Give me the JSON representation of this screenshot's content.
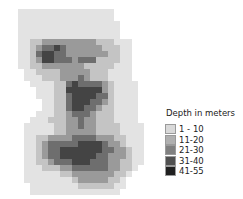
{
  "legend": {
    "title": "Depth in meters",
    "classes": [
      {
        "label": "1 - 10",
        "color": "#d9d9d9"
      },
      {
        "label": "11-20",
        "color": "#b0b0b0"
      },
      {
        "label": "21-30",
        "color": "#808080"
      },
      {
        "label": "31-40",
        "color": "#505050"
      },
      {
        "label": "41-55",
        "color": "#202020"
      }
    ]
  },
  "map": {
    "cell_px": 6,
    "cols": 22,
    "background_color": "#e3e3e3",
    "grid": [
      "0000000000000000------",
      "0000000000000000------",
      "00000000000000000-----",
      "00000000000000000-----",
      "00000000000000000-----",
      "0011222222222111000---",
      "0012334322222211100---",
      "0013443322222221100---",
      "0012443332333111100---",
      "0011222222211111000---",
      "-001111222221110000---",
      "-000111222321110000---",
      "--000011343333210000--",
      "---00011444444210000--",
      "---00011344443310000--",
      "----0011344433210000--",
      "----0011344332110000--",
      "---00011233321110000--",
      "--000111223221110000--",
      "-00000112232211110000-",
      "-00000112222211110000-",
      "-00112222333322211000-",
      "-00123333344443221000-",
      "-00123344444443322100-",
      "-00123344444433222100-",
      "-00112333444333221100-",
      "-0001112233333322110--",
      "-000000112222222110---",
      "-00000000122222110----",
      "--0000000011111100----",
      "--000000000000000-----",
      "---------------------- "
    ]
  }
}
